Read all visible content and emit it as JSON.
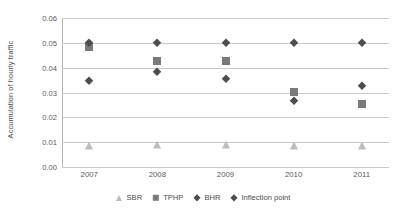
{
  "chart_data": {
    "type": "scatter",
    "title": "",
    "xlabel": "",
    "ylabel": "Accumulation of hourly traffic",
    "categories": [
      "2007",
      "2008",
      "2009",
      "2010",
      "2011"
    ],
    "x": [
      2007,
      2008,
      2009,
      2010,
      2011
    ],
    "ylim": [
      0.0,
      0.06
    ],
    "xlim": [
      2006.6,
      2011.4
    ],
    "yticks": [
      "0.00",
      "0.01",
      "0.02",
      "0.03",
      "0.04",
      "0.05",
      "0.06"
    ],
    "ytick_values": [
      0.0,
      0.01,
      0.02,
      0.03,
      0.04,
      0.05,
      0.06
    ],
    "grid": true,
    "grid_axis": "y",
    "legend_position": "bottom",
    "series": [
      {
        "name": "SBR",
        "marker": "triangle",
        "color": "#bdbdbd",
        "values": [
          0.0085,
          0.0088,
          0.0088,
          0.0084,
          0.0083
        ]
      },
      {
        "name": "TPHP",
        "marker": "square",
        "color": "#7a7a7a",
        "values": [
          0.0482,
          0.0425,
          0.0428,
          0.0302,
          0.0253
        ]
      },
      {
        "name": "BHR",
        "marker": "diamond",
        "color": "#4d4d4d",
        "values": [
          0.05,
          0.05,
          0.05,
          0.05,
          0.05
        ]
      },
      {
        "name": "Inflection point",
        "marker": "diamond",
        "color": "#4d4d4d",
        "values": [
          0.0348,
          0.0383,
          0.0355,
          0.0265,
          0.0328
        ]
      }
    ]
  },
  "legend": {
    "items": [
      {
        "label": "SBR"
      },
      {
        "label": "TPHP"
      },
      {
        "label": "BHR"
      },
      {
        "label": "Inflection point"
      }
    ]
  }
}
